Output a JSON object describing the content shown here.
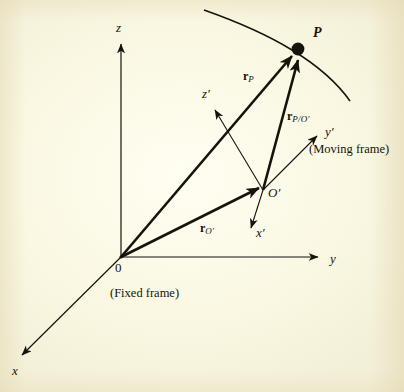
{
  "figure": {
    "kind": "vector-kinematics-diagram",
    "background_color": "#fcfbe6",
    "ink_color": "#15130c",
    "width": 404,
    "height": 392
  },
  "axes": {
    "fixed": {
      "frame_caption": "(Fixed frame)",
      "origin_label": "0",
      "labels": {
        "x": "x",
        "y": "y",
        "z": "z"
      }
    },
    "moving": {
      "frame_caption": "(Moving frame)",
      "origin_label": "O′",
      "labels": {
        "x_prime": "x′",
        "y_prime": "y′",
        "z_prime": "z′"
      }
    }
  },
  "points": {
    "particle_label": "P"
  },
  "vectors": [
    {
      "id": "r-P",
      "bold": "r",
      "subscript": "P",
      "description": "position of P in fixed frame"
    },
    {
      "id": "r-P-rel-Oprime",
      "bold": "r",
      "subscript": "P/O′",
      "description": "position of P relative to moving origin"
    },
    {
      "id": "r-Oprime",
      "bold": "r",
      "subscript": "O′",
      "description": "position of moving origin in fixed frame"
    }
  ]
}
